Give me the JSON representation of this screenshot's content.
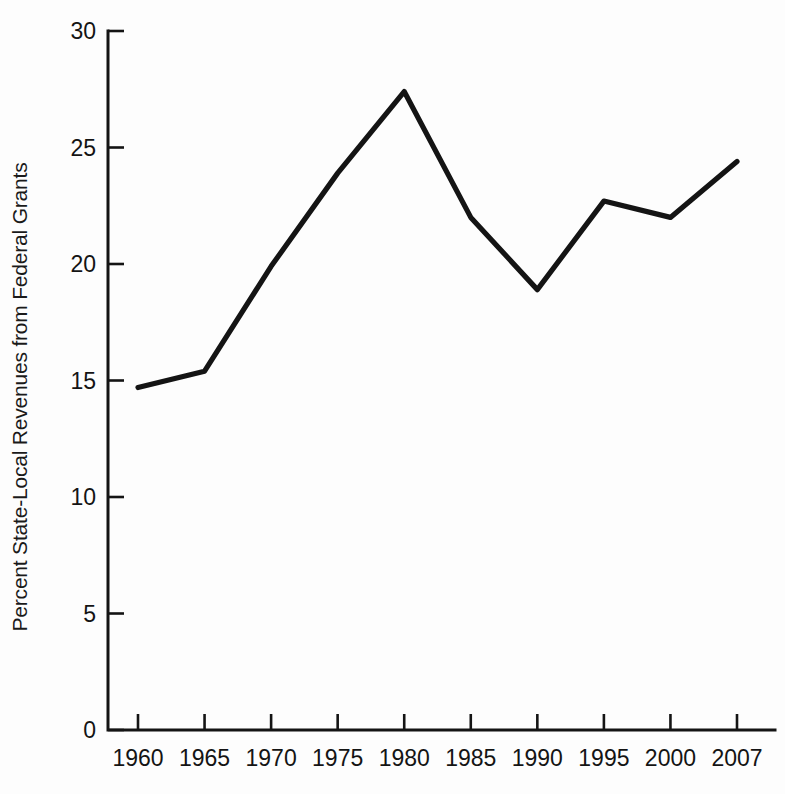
{
  "chart_data": {
    "type": "line",
    "title": "",
    "xlabel": "",
    "ylabel": "Percent State-Local Revenues from Federal Grants",
    "categories": [
      "1960",
      "1965",
      "1970",
      "1975",
      "1980",
      "1985",
      "1990",
      "1995",
      "2000",
      "2007"
    ],
    "values": [
      14.7,
      15.4,
      19.9,
      23.9,
      27.4,
      22.0,
      18.9,
      22.7,
      22.0,
      24.4
    ],
    "series": [
      {
        "name": "Percent State-Local Revenues from Federal Grants",
        "values": [
          14.7,
          15.4,
          19.9,
          23.9,
          27.4,
          22.0,
          18.9,
          22.7,
          22.0,
          24.4
        ]
      }
    ],
    "ylim": [
      0,
      30
    ],
    "yticks": [
      "0",
      "5",
      "10",
      "15",
      "20",
      "25",
      "30"
    ],
    "ytick_values": [
      0,
      5,
      10,
      15,
      20,
      25,
      30
    ],
    "xticks": [
      "1960",
      "1965",
      "1970",
      "1975",
      "1980",
      "1985",
      "1990",
      "1995",
      "2000",
      "2007"
    ],
    "grid": false,
    "legend": false,
    "legend_position": "none",
    "line_color": "#141414",
    "background_color": "#fdfdfd"
  }
}
